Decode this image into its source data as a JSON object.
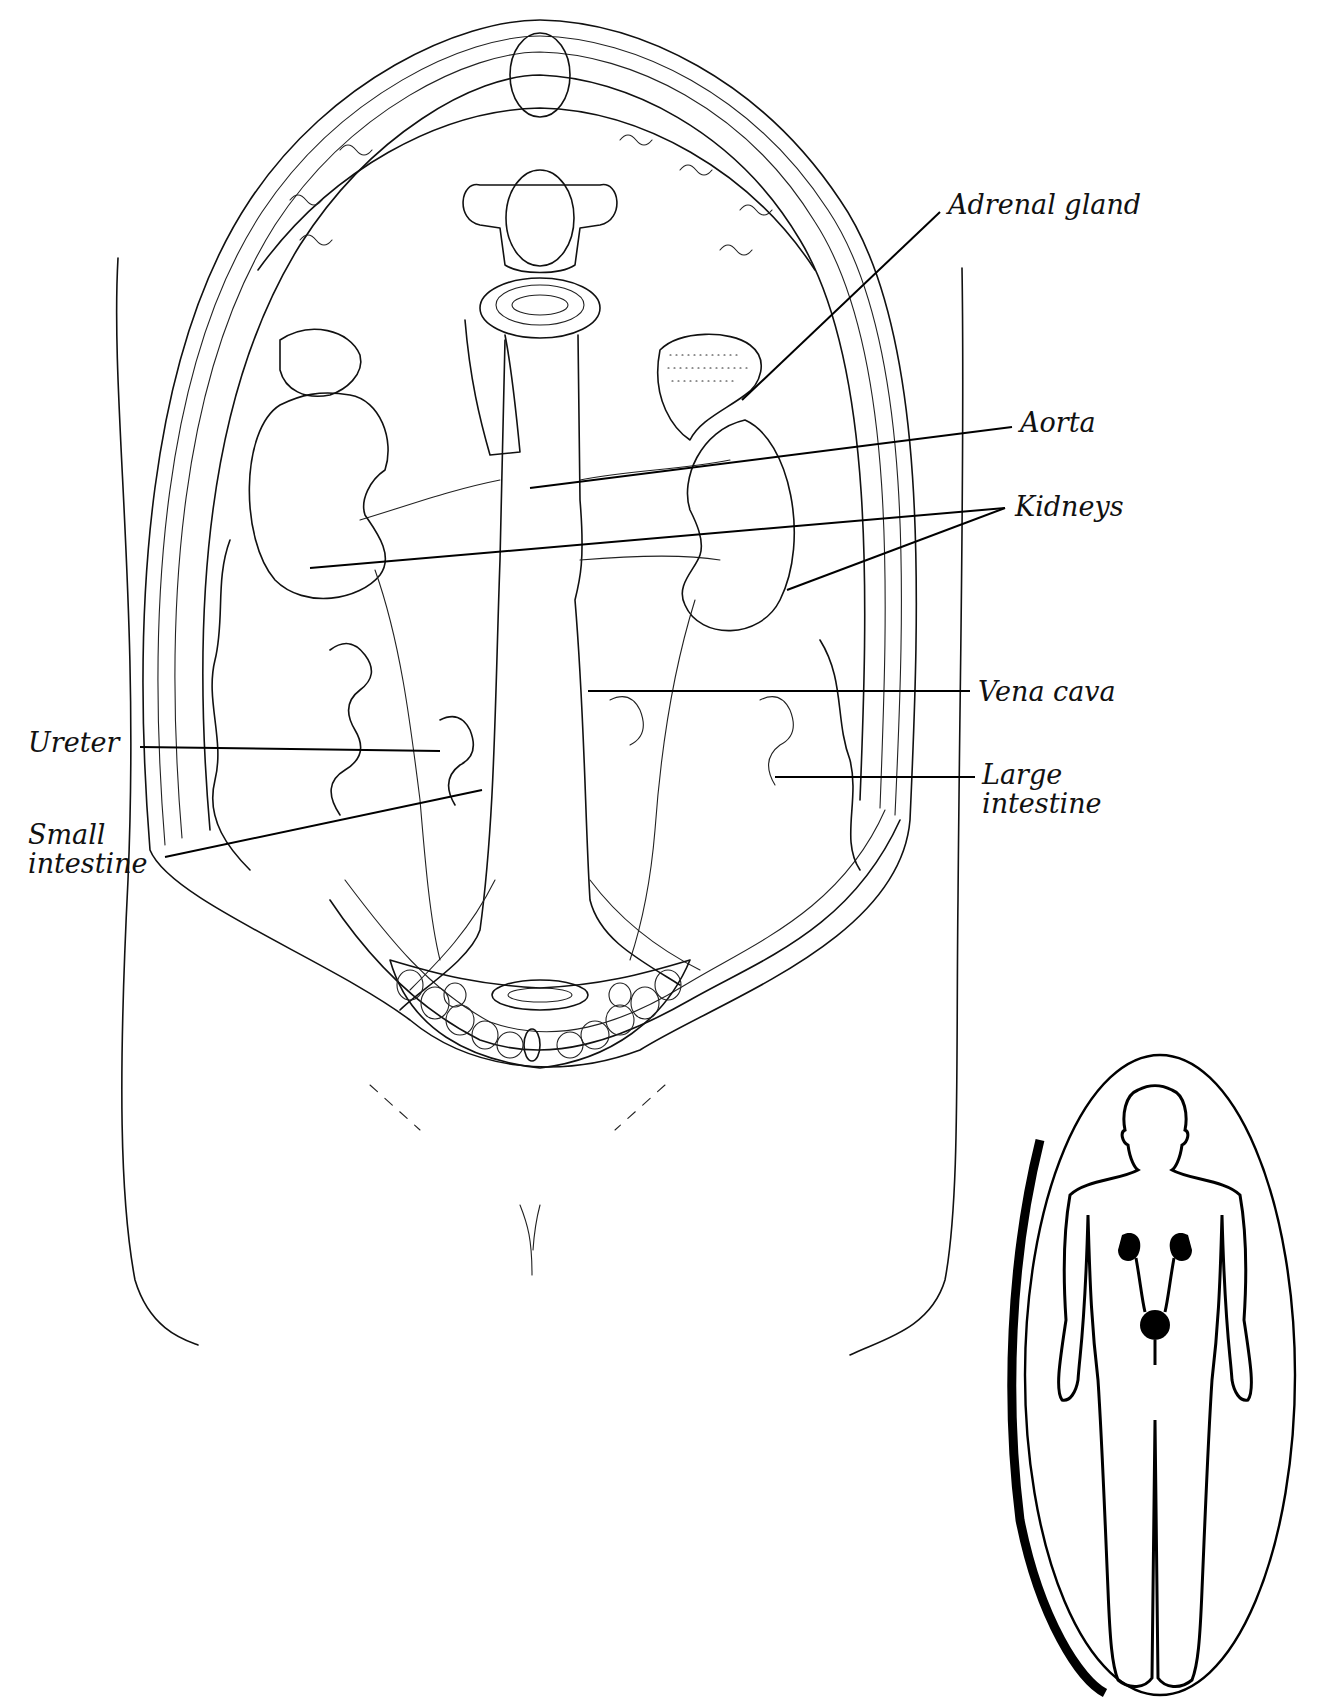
{
  "figure": {
    "colors": {
      "ink": "#111111",
      "background": "#ffffff"
    }
  },
  "labels": [
    {
      "id": "adrenal-gland",
      "text": "Adrenal gland",
      "x": 948,
      "y": 190,
      "leader": [
        [
          940,
          210
        ],
        [
          740,
          400
        ]
      ]
    },
    {
      "id": "aorta",
      "text": "Aorta",
      "x": 1020,
      "y": 408,
      "leader": [
        [
          1012,
          427
        ],
        [
          530,
          480
        ]
      ]
    },
    {
      "id": "kidneys",
      "text": "Kidneys",
      "x": 1015,
      "y": 492,
      "leader": [
        [
          1005,
          508
        ],
        [
          310,
          566
        ]
      ],
      "leader2": [
        [
          1005,
          508
        ],
        [
          787,
          590
        ]
      ]
    },
    {
      "id": "vena-cava",
      "text": "Vena cava",
      "x": 978,
      "y": 679,
      "leader": [
        [
          970,
          691
        ],
        [
          588,
          691
        ]
      ]
    },
    {
      "id": "ureter",
      "text": "Ureter",
      "x": 28,
      "y": 728,
      "leader": [
        [
          140,
          747
        ],
        [
          440,
          751
        ]
      ]
    },
    {
      "id": "large-intestine",
      "text": "Large\nintestine",
      "x": 982,
      "y": 763,
      "leader": [
        [
          975,
          777
        ],
        [
          775,
          777
        ]
      ]
    },
    {
      "id": "small-intestine",
      "text": "Small\nintestine",
      "x": 28,
      "y": 822,
      "leader": [
        [
          165,
          857
        ],
        [
          482,
          790
        ]
      ]
    }
  ],
  "inset": {
    "description": "Body silhouette in oval highlighting kidneys, ureters and bladder",
    "organs_highlighted": [
      "kidneys",
      "ureters",
      "bladder"
    ]
  }
}
